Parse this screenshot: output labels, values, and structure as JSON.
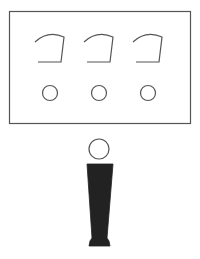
{
  "diagram": {
    "colors": {
      "stroke": "#555555",
      "figure_fill": "#222222",
      "background": "#ffffff"
    },
    "panel": {
      "gauges": [
        {
          "id": "gauge-1"
        },
        {
          "id": "gauge-2"
        },
        {
          "id": "gauge-3"
        }
      ],
      "buttons": [
        {
          "id": "circle-1"
        },
        {
          "id": "circle-2"
        },
        {
          "id": "circle-3"
        }
      ]
    },
    "figure": {
      "label": ""
    }
  }
}
